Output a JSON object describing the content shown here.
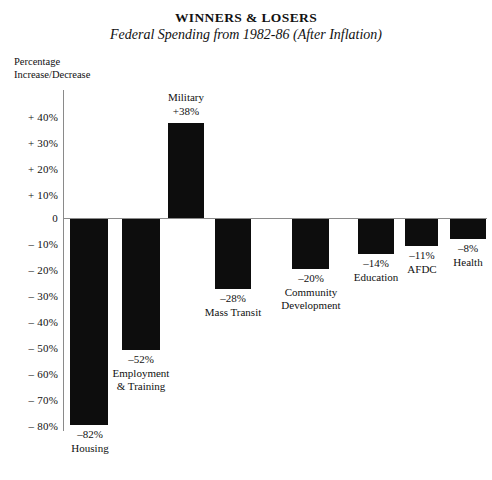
{
  "chart_data": {
    "type": "bar",
    "title": "WINNERS & LOSERS",
    "subtitle": "Federal Spending from 1982-86 (After Inflation)",
    "xlabel": "",
    "ylabel": "Percentage Increase/Decrease",
    "ylim": [
      -80,
      40
    ],
    "ytick_step": 10,
    "grid": false,
    "legend": "none",
    "orientation": "vertical",
    "bar_color": "#0d0d0d",
    "categories": [
      "Housing",
      "Employment & Training",
      "Military",
      "Mass Transit",
      "Community Development",
      "Education",
      "AFDC",
      "Health"
    ],
    "values": [
      -82,
      -52,
      38,
      -28,
      -20,
      -14,
      -11,
      -8
    ],
    "value_labels": [
      "–82%",
      "–52%",
      "+38%",
      "–28%",
      "–20%",
      "–14%",
      "–11%",
      "–8%"
    ],
    "ytick_labels": [
      "+ 40%",
      "+ 30%",
      "+ 20%",
      "+ 10%",
      "0",
      "– 10%",
      "– 20%",
      "– 30%",
      "– 40%",
      "– 50%",
      "– 60%",
      "– 70%",
      "– 80%"
    ],
    "ytick_values": [
      40,
      30,
      20,
      10,
      0,
      -10,
      -20,
      -30,
      -40,
      -50,
      -60,
      -70,
      -80
    ]
  },
  "axis": {
    "caption": "Percentage\nIncrease/Decrease"
  },
  "ticks": [
    {
      "label": "+ 40%",
      "top": 112
    },
    {
      "label": "+ 30%",
      "top": 138
    },
    {
      "label": "+ 20%",
      "top": 164
    },
    {
      "label": "+ 10%",
      "top": 190
    },
    {
      "label": "0",
      "top": 213
    },
    {
      "label": "– 10%",
      "top": 239
    },
    {
      "label": "– 20%",
      "top": 265
    },
    {
      "label": "– 30%",
      "top": 291
    },
    {
      "label": "– 40%",
      "top": 317
    },
    {
      "label": "– 50%",
      "top": 343
    },
    {
      "label": "– 60%",
      "top": 369
    },
    {
      "label": "– 70%",
      "top": 395
    },
    {
      "label": "– 80%",
      "top": 421
    }
  ],
  "bars": [
    {
      "name": "housing",
      "value_label": "–82%",
      "category": "Housing",
      "left": 70,
      "width": 38,
      "top": 219,
      "height": 206,
      "note_left": 52,
      "note_top": 428,
      "note_width": 76
    },
    {
      "name": "employment-training",
      "value_label": "–52%",
      "category": "Employment\n& Training",
      "left": 122,
      "width": 38,
      "top": 219,
      "height": 131,
      "note_left": 96,
      "note_top": 353,
      "note_width": 90
    },
    {
      "name": "military",
      "value_label": "+38%",
      "category": "Military",
      "left": 168,
      "width": 36,
      "top": 123,
      "height": 95,
      "note_left": 144,
      "note_top": 91,
      "note_width": 84
    },
    {
      "name": "mass-transit",
      "value_label": "–28%",
      "category": "Mass Transit",
      "left": 215,
      "width": 36,
      "top": 219,
      "height": 70,
      "note_left": 186,
      "note_top": 292,
      "note_width": 94
    },
    {
      "name": "community-development",
      "value_label": "–20%",
      "category": "Community\nDevelopment",
      "left": 292,
      "width": 37,
      "top": 219,
      "height": 50,
      "note_left": 264,
      "note_top": 272,
      "note_width": 94
    },
    {
      "name": "education",
      "value_label": "–14%",
      "category": "Education",
      "left": 358,
      "width": 36,
      "top": 219,
      "height": 35,
      "note_left": 333,
      "note_top": 257,
      "note_width": 86
    },
    {
      "name": "afdc",
      "value_label": "–11%",
      "category": "AFDC",
      "left": 405,
      "width": 33,
      "top": 219,
      "height": 27,
      "note_left": 390,
      "note_top": 249,
      "note_width": 64
    },
    {
      "name": "health",
      "value_label": "–8%",
      "category": "Health",
      "left": 450,
      "width": 36,
      "top": 219,
      "height": 20,
      "note_left": 440,
      "note_top": 242,
      "note_width": 56
    }
  ]
}
